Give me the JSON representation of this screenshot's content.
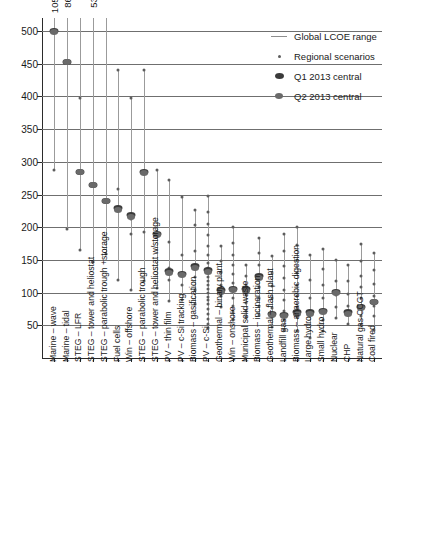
{
  "legend": {
    "position": "top-right",
    "items": [
      {
        "label": "Global LCOE range",
        "mark": "line",
        "name": "global-lcoe-range"
      },
      {
        "label": "Regional scenarios",
        "mark": "small-dot",
        "name": "regional-scenarios"
      },
      {
        "label": "Q1 2013 central",
        "mark": "large-dark-dot",
        "name": "q1-2013-central"
      },
      {
        "label": "Q2 2013 central",
        "mark": "large-grey-dot",
        "name": "q2-2013-central"
      }
    ]
  },
  "chart_data": {
    "type": "scatter",
    "title": "",
    "xlabel": "",
    "ylabel": "",
    "ylim": [
      0,
      520
    ],
    "yticks": [
      50,
      100,
      150,
      200,
      250,
      300,
      350,
      400,
      450,
      500
    ],
    "ytick_labels": [
      "50",
      "100",
      "150",
      "200",
      "250",
      "300",
      "350",
      "400",
      "450",
      "500"
    ],
    "grid": true,
    "legend_position": "top-right",
    "categories": [
      "Marine – wave",
      "Marine – tidal",
      "STEG – LFR",
      "STEG – tower and heliostat",
      "STEG – parabolic trough +storage",
      "Fuel cells",
      "Win – offshore",
      "STEG – parabolic trough",
      "STEG – tower and heliostat w/storage",
      "PV – thin film",
      "PV – c-Si tracking",
      "Biomass – gasification",
      "PV – c-Si",
      "Geothermal – binary plant",
      "Win – onshore",
      "Municipal solid waste",
      "Biomass – incineration",
      "Geothermal – flash plant",
      "Landfill gas",
      "Biomass – anaerobic digestion",
      "Large hydro",
      "Small hydro",
      "Nuclear",
      "CHP",
      "Natural gas CCGT",
      "Coal fired"
    ],
    "top_annotations": [
      {
        "category_index": 0,
        "value": "1059"
      },
      {
        "category_index": 1,
        "value": "861"
      },
      {
        "category_index": 3,
        "value": "531"
      }
    ],
    "series": [
      {
        "name": "Global LCOE range",
        "type": "range-stem",
        "ranges": [
          [
            287,
            520
          ],
          [
            197,
            520
          ],
          [
            165,
            520
          ],
          [
            147,
            520
          ],
          [
            159,
            520
          ],
          [
            119,
            441
          ],
          [
            104,
            398
          ],
          [
            118,
            441
          ],
          [
            107,
            288
          ],
          [
            87,
            273
          ],
          [
            88,
            246
          ],
          [
            82,
            226
          ],
          [
            46,
            248
          ],
          [
            78,
            172
          ],
          [
            58,
            201
          ],
          [
            62,
            143
          ],
          [
            66,
            184
          ],
          [
            48,
            156
          ],
          [
            43,
            190
          ],
          [
            41,
            200
          ],
          [
            31,
            158
          ],
          [
            42,
            166
          ],
          [
            61,
            150
          ],
          [
            52,
            143
          ],
          [
            50,
            175
          ],
          [
            43,
            161
          ]
        ]
      },
      {
        "name": "Regional scenarios",
        "type": "points",
        "points": [
          {
            "category_index": 0,
            "values": [
              287,
              500
            ]
          },
          {
            "category_index": 1,
            "values": [
              197
            ]
          },
          {
            "category_index": 2,
            "values": [
              397,
              165
            ]
          },
          {
            "category_index": 3,
            "values": [
              147
            ]
          },
          {
            "category_index": 4,
            "values": [
              159
            ]
          },
          {
            "category_index": 5,
            "values": [
              441,
              258,
              119
            ]
          },
          {
            "category_index": 6,
            "values": [
              398,
              213,
              190,
              104
            ]
          },
          {
            "category_index": 7,
            "values": [
              441,
              192,
              118
            ]
          },
          {
            "category_index": 8,
            "values": [
              288,
              107
            ]
          },
          {
            "category_index": 9,
            "values": [
              273,
              178,
              137,
              119,
              87
            ]
          },
          {
            "category_index": 10,
            "values": [
              246,
              157,
              130,
              111,
              88
            ]
          },
          {
            "category_index": 11,
            "values": [
              226,
              203,
              163,
              140,
              124,
              104,
              82
            ]
          },
          {
            "category_index": 12,
            "values": [
              248,
              223,
              205,
              188,
              172,
              158,
              145,
              138,
              131,
              124,
              118,
              112,
              106,
              100,
              94,
              88,
              82,
              75,
              68,
              60,
              52,
              46
            ]
          },
          {
            "category_index": 13,
            "values": [
              172,
              149,
              131,
              112,
              95,
              78
            ]
          },
          {
            "category_index": 14,
            "values": [
              201,
              176,
              158,
              142,
              128,
              115,
              103,
              92,
              80,
              70,
              58
            ]
          },
          {
            "category_index": 15,
            "values": [
              143,
              125,
              110,
              96,
              84,
              72,
              62
            ]
          },
          {
            "category_index": 16,
            "values": [
              184,
              160,
              142,
              124,
              108,
              92,
              79,
              66
            ]
          },
          {
            "category_index": 17,
            "values": [
              156,
              130,
              110,
              92,
              76,
              62,
              48
            ]
          },
          {
            "category_index": 18,
            "values": [
              190,
              163,
              141,
              122,
              104,
              88,
              72,
              58,
              43
            ]
          },
          {
            "category_index": 19,
            "values": [
              200,
              173,
              150,
              130,
              112,
              95,
              78,
              62,
              41
            ]
          },
          {
            "category_index": 20,
            "values": [
              158,
              120,
              92,
              68,
              31
            ]
          },
          {
            "category_index": 21,
            "values": [
              166,
              136,
              112,
              92,
              74,
              58,
              42
            ]
          },
          {
            "category_index": 22,
            "values": [
              150,
              118,
              96,
              78,
              61
            ]
          },
          {
            "category_index": 23,
            "values": [
              143,
              118,
              98,
              80,
              66,
              52
            ]
          },
          {
            "category_index": 24,
            "values": [
              175,
              148,
              126,
              108,
              92,
              78,
              65,
              50
            ]
          },
          {
            "category_index": 25,
            "values": [
              161,
              134,
              113,
              95,
              79,
              64,
              43
            ]
          }
        ]
      },
      {
        "name": "Q1 2013 central",
        "type": "points",
        "values": [
          500,
          452,
          285,
          265,
          240,
          229,
          218,
          285,
          190,
          133,
          129,
          140,
          134,
          104,
          106,
          105,
          125,
          68,
          66,
          70,
          70,
          72,
          101,
          70,
          78,
          86
        ]
      },
      {
        "name": "Q2 2013 central",
        "type": "points",
        "values": [
          498,
          452,
          284,
          264,
          240,
          226,
          216,
          283,
          188,
          130,
          127,
          137,
          131,
          101,
          104,
          103,
          122,
          66,
          64,
          68,
          68,
          70,
          99,
          68,
          76,
          85
        ]
      }
    ]
  }
}
